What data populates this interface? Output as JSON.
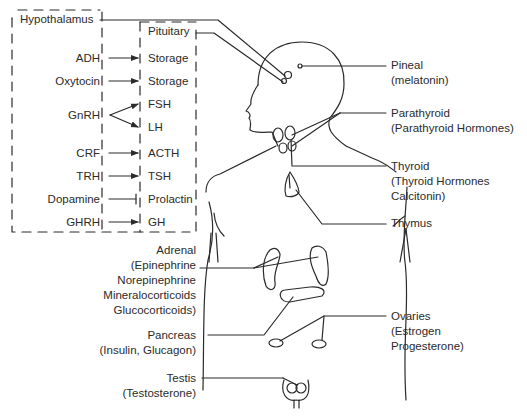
{
  "hypothalamus_box": {
    "title": "Hypothalamus",
    "releasing_hormones": [
      {
        "label": "ADH",
        "relation": "stimulates"
      },
      {
        "label": "Oxytocin",
        "relation": "stimulates"
      },
      {
        "label": "GnRH",
        "relation": "stimulates"
      },
      {
        "label": "CRF",
        "relation": "stimulates"
      },
      {
        "label": "TRH",
        "relation": "stimulates"
      },
      {
        "label": "Dopamine",
        "relation": "inhibits"
      },
      {
        "label": "GHRH",
        "relation": "stimulates"
      }
    ]
  },
  "pituitary_box": {
    "title": "Pituitary",
    "outputs": [
      "Storage",
      "Storage",
      "FSH",
      "LH",
      "ACTH",
      "TSH",
      "Prolactin",
      "GH"
    ]
  },
  "glands": {
    "pineal": {
      "name": "Pineal",
      "hormones": "(melatonin)"
    },
    "parathyroid": {
      "name": "Parathyroid",
      "hormones": "(Parathyroid Hormones)"
    },
    "thyroid": {
      "name": "Thyroid",
      "hormones_line1": "(Thyroid Hormones",
      "hormones_line2": "Calcitonin)"
    },
    "thymus": {
      "name": "Thymus"
    },
    "adrenal": {
      "name": "Adrenal",
      "hormones_line1": "(Epinephrine",
      "hormones_line2": "Norepinephrine",
      "hormones_line3": "Mineralocorticoids",
      "hormones_line4": "Glucocorticoids)"
    },
    "pancreas": {
      "name": "Pancreas",
      "hormones": "(Insulin, Glucagon)"
    },
    "ovaries": {
      "name": "Ovaries",
      "hormones_line1": "(Estrogen",
      "hormones_line2": "Progesterone)"
    },
    "testis": {
      "name": "Testis",
      "hormones": "(Testosterone)"
    }
  },
  "colors": {
    "line": "#2a2a2a",
    "text": "#2b2b2b",
    "background": "#ffffff"
  }
}
